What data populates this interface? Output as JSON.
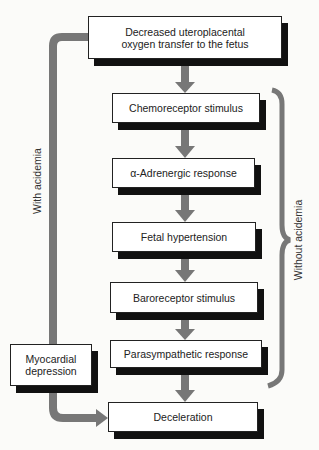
{
  "nodes": {
    "top": "Decreased uteroplacental oxygen transfer to the fetus",
    "top_line1": "Decreased uteroplacental",
    "top_line2": "oxygen transfer to the fetus",
    "chemoreceptor": "Chemoreceptor stimulus",
    "adrenergic": "α-Adrenergic response",
    "hypertension": "Fetal hypertension",
    "baroreceptor": "Baroreceptor stimulus",
    "parasympathetic": "Parasympathetic response",
    "myocardial_line1": "Myocardial",
    "myocardial_line2": "depression",
    "deceleration": "Deceleration"
  },
  "labels": {
    "with_acidemia": "With acidemia",
    "without_acidemia": "Without acidemia"
  },
  "colors": {
    "arrow": "#777777",
    "shadow": "#111111",
    "box": "#ffffff"
  }
}
